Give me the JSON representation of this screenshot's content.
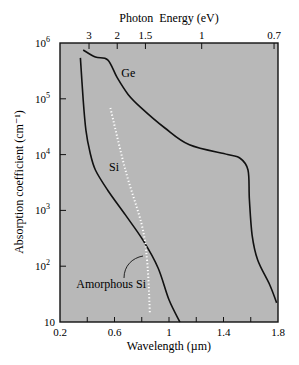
{
  "chart_data": {
    "type": "line",
    "title": "",
    "xlabel": "Wavelength (µm)",
    "ylabel": "Absorption coefficient (cm⁻¹)",
    "top_xlabel": "Photon  Energy (eV)",
    "xlim": [
      0.2,
      1.8
    ],
    "ylim": [
      10,
      1000000
    ],
    "yscale": "log",
    "grid": false,
    "legend": "none (inline curve labels)",
    "x_ticks": [
      0.2,
      0.4,
      0.6,
      0.8,
      1.0,
      1.2,
      1.4,
      1.6,
      1.8
    ],
    "x_tick_labels": [
      {
        "value": 0.2,
        "label": "0.2"
      },
      {
        "value": 0.6,
        "label": "0.6"
      },
      {
        "value": 1.0,
        "label": "1"
      },
      {
        "value": 1.4,
        "label": "1.4"
      },
      {
        "value": 1.8,
        "label": "1.8"
      }
    ],
    "y_ticks": [
      {
        "value": 10,
        "label": "10",
        "exp": ""
      },
      {
        "value": 100,
        "label": "10",
        "exp": "2"
      },
      {
        "value": 1000,
        "label": "10",
        "exp": "3"
      },
      {
        "value": 10000,
        "label": "10",
        "exp": "4"
      },
      {
        "value": 100000,
        "label": "10",
        "exp": "5"
      },
      {
        "value": 1000000,
        "label": "10",
        "exp": "6"
      }
    ],
    "top_ticks": [
      {
        "energy_eV": 3,
        "label": "3",
        "wavelength_um": 0.413
      },
      {
        "energy_eV": 2,
        "label": "2",
        "wavelength_um": 0.62
      },
      {
        "energy_eV": 1.5,
        "label": "1.5",
        "wavelength_um": 0.827
      },
      {
        "energy_eV": 1,
        "label": "1",
        "wavelength_um": 1.24
      },
      {
        "energy_eV": 0.7,
        "label": "0.7",
        "wavelength_um": 1.771
      }
    ],
    "series": [
      {
        "name": "Ge",
        "style": "solid",
        "x": [
          0.37,
          0.46,
          0.55,
          0.62,
          0.7,
          0.79,
          0.97,
          1.15,
          1.43,
          1.52,
          1.58,
          1.59,
          1.61,
          1.65,
          1.74,
          1.79
        ],
        "values": [
          750000,
          560000,
          500000,
          240000,
          120000,
          71000,
          30000,
          15000,
          10000,
          8700,
          5300,
          1550,
          360,
          130,
          46,
          22
        ],
        "label_pos": {
          "x": 0.65,
          "y": 250000
        }
      },
      {
        "name": "Si",
        "style": "solid",
        "x": [
          0.35,
          0.37,
          0.39,
          0.42,
          0.46,
          0.55,
          0.68,
          0.81,
          0.92,
          1.0,
          1.08
        ],
        "values": [
          540000,
          95000,
          27500,
          11000,
          5300,
          2300,
          830,
          290,
          93,
          25,
          10
        ],
        "label_pos": {
          "x": 0.56,
          "y": 5000
        }
      },
      {
        "name": "Amorphous Si",
        "style": "dotted",
        "x": [
          0.57,
          0.68,
          0.8,
          0.84,
          0.86
        ],
        "values": [
          68000,
          5300,
          550,
          120,
          14
        ],
        "label_pos": {
          "x": 0.32,
          "y": 40
        }
      }
    ],
    "background_color": "#b8b8b8",
    "line_color": "#111111"
  }
}
